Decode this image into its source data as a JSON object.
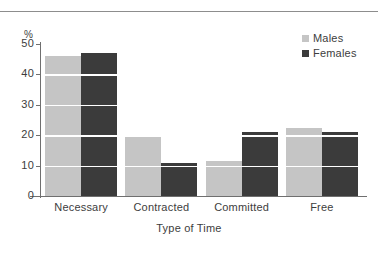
{
  "chart_data": {
    "type": "bar",
    "title": "",
    "xlabel": "Type of Time",
    "ylabel": "%",
    "categories": [
      "Necessary",
      "Contracted",
      "Committed",
      "Free"
    ],
    "series": [
      {
        "name": "Males",
        "color": "#c5c5c5",
        "values": [
          46,
          20,
          11.5,
          22.5
        ]
      },
      {
        "name": "Females",
        "color": "#3b3b3b",
        "values": [
          47,
          11,
          21,
          21
        ]
      }
    ],
    "ylim": [
      0,
      50
    ],
    "yticks": [
      0,
      10,
      20,
      30,
      40,
      50
    ],
    "ytick_labels": [
      "0",
      "10",
      "20",
      "30",
      "40",
      "50"
    ],
    "grid": "horizontal-white-overlay",
    "legend_position": "top-right",
    "bar_group_style": "paired-adjacent"
  },
  "axis": {
    "unit_label": "%",
    "x_title": "Type of Time"
  },
  "legend": {
    "items": [
      {
        "label": "Males",
        "color": "#c5c5c5"
      },
      {
        "label": "Females",
        "color": "#3b3b3b"
      }
    ]
  }
}
